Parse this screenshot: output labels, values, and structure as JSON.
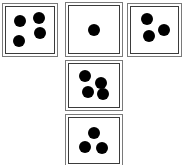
{
  "scene": {
    "title": "Dice net arrangement",
    "description": "Five dice arranged in a T shape: three across the top row, one below the middle, one at the bottom",
    "background_color": "#ffffff",
    "face_color": "#ffffff",
    "pip_color": "#000000",
    "border_color": "#3b3b3b",
    "outer_border_color": "#7a7a7a",
    "canvas": {
      "width": 184,
      "height": 165
    }
  },
  "dice": [
    {
      "name": "die-top-left",
      "position_label": "top-left",
      "value": 4,
      "box": {
        "x": 2,
        "y": 3,
        "w": 56,
        "h": 54
      },
      "pip_radius": 6,
      "pips": [
        {
          "cx": 30,
          "cy": 30
        },
        {
          "cx": 68,
          "cy": 24
        },
        {
          "cx": 71,
          "cy": 57
        },
        {
          "cx": 27,
          "cy": 73
        }
      ]
    },
    {
      "name": "die-top-middle",
      "position_label": "top-middle",
      "value": 1,
      "box": {
        "x": 65,
        "y": 2,
        "w": 58,
        "h": 55
      },
      "pip_radius": 6,
      "pips": [
        {
          "cx": 50,
          "cy": 50
        }
      ]
    },
    {
      "name": "die-top-right",
      "position_label": "top-right",
      "value": 3,
      "box": {
        "x": 127,
        "y": 3,
        "w": 55,
        "h": 54
      },
      "pip_radius": 6,
      "pips": [
        {
          "cx": 33,
          "cy": 25
        },
        {
          "cx": 70,
          "cy": 49
        },
        {
          "cx": 38,
          "cy": 63
        }
      ]
    },
    {
      "name": "die-center",
      "position_label": "center",
      "value": 4,
      "box": {
        "x": 65,
        "y": 60,
        "w": 58,
        "h": 51
      },
      "pip_radius": 6,
      "pips": [
        {
          "cx": 32,
          "cy": 29
        },
        {
          "cx": 64,
          "cy": 44
        },
        {
          "cx": 38,
          "cy": 66
        },
        {
          "cx": 68,
          "cy": 70
        }
      ]
    },
    {
      "name": "die-bottom",
      "position_label": "bottom",
      "value": 3,
      "box": {
        "x": 65,
        "y": 114,
        "w": 58,
        "h": 53
      },
      "pip_radius": 6,
      "pips": [
        {
          "cx": 49,
          "cy": 33
        },
        {
          "cx": 32,
          "cy": 65
        },
        {
          "cx": 66,
          "cy": 66
        }
      ]
    }
  ]
}
